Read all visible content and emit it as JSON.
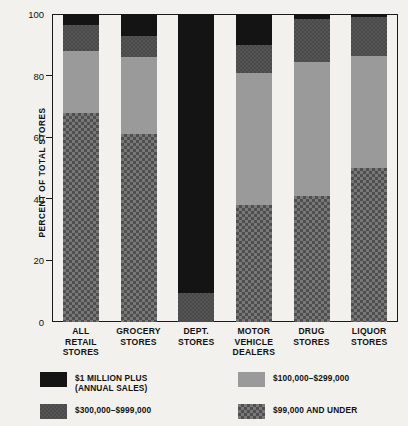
{
  "chart_data": {
    "type": "bar",
    "subtype": "stacked-bar-100",
    "title": "",
    "xlabel": "",
    "ylabel": "PERCENT OF TOTAL STORES",
    "ylim": [
      0,
      100
    ],
    "yticks": [
      0,
      20,
      40,
      60,
      80,
      100
    ],
    "grid": false,
    "legend_position": "bottom",
    "categories": [
      "ALL RETAIL STORES",
      "GROCERY STORES",
      "DEPT. STORES",
      "MOTOR VEHICLE DEALERS",
      "DRUG STORES",
      "LIQUOR STORES"
    ],
    "category_lines": [
      [
        "ALL",
        "RETAIL",
        "STORES"
      ],
      [
        "GROCERY",
        "STORES"
      ],
      [
        "DEPT.",
        "STORES"
      ],
      [
        "MOTOR",
        "VEHICLE",
        "DEALERS"
      ],
      [
        "DRUG",
        "STORES"
      ],
      [
        "LIQUOR",
        "STORES"
      ]
    ],
    "series": [
      {
        "name": "$99,000 AND UNDER",
        "fill": "check",
        "color": "#787878",
        "values": [
          68,
          61,
          0,
          38,
          41,
          50
        ]
      },
      {
        "name": "$100,000–$299,000",
        "fill": "light",
        "color": "#9a9a9a",
        "values": [
          20,
          25,
          0,
          43,
          43.5,
          36.5
        ]
      },
      {
        "name": "$300,000–$999,000",
        "fill": "dark",
        "color": "#4a4a4a",
        "values": [
          8.5,
          7,
          9.5,
          9,
          14,
          12.5
        ]
      },
      {
        "name": "$1 MILLION PLUS (ANNUAL SALES)",
        "fill": "black",
        "color": "#141414",
        "values": [
          3.5,
          7,
          90.5,
          10,
          1.5,
          1
        ]
      }
    ]
  },
  "legend": [
    {
      "label": "$1 MILLION PLUS",
      "sublabel": "(ANNUAL SALES)",
      "fill": "black"
    },
    {
      "label": "$100,000–$299,000",
      "sublabel": "",
      "fill": "light"
    },
    {
      "label": "$300,000–$999,000",
      "sublabel": "",
      "fill": "dark"
    },
    {
      "label": "$99,000 AND UNDER",
      "sublabel": "",
      "fill": "check"
    }
  ]
}
